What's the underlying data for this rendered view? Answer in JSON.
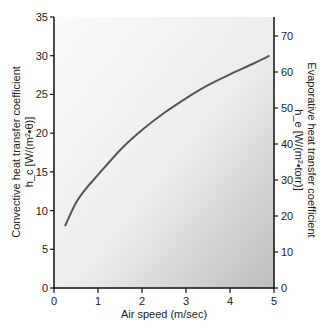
{
  "chart_data": {
    "type": "line",
    "title": "",
    "xlabel": "Air speed (m/sec)",
    "ylabel": "Convective heat transfer coefficient",
    "ylabel_units": "h_c [W/(m²•θ)]",
    "ylabel_right": "Evaporative heat transfer coefficient",
    "ylabel_right_units": "h_e [W/(m²•torr)]",
    "xlim": [
      0,
      5
    ],
    "ylim": [
      0,
      35
    ],
    "ylim_right": [
      0,
      80
    ],
    "x_ticks": [
      "0",
      "1",
      "2",
      "3",
      "4",
      "5"
    ],
    "y_ticks": [
      "0",
      "5",
      "10",
      "15",
      "20",
      "25",
      "30",
      "35"
    ],
    "y_right_ticks": [
      "0",
      "10",
      "20",
      "30",
      "40",
      "50",
      "60",
      "70"
    ],
    "grid": false,
    "legend": null,
    "series": [
      {
        "name": "h_c vs air speed",
        "x": [
          0.25,
          0.5,
          0.75,
          1.0,
          1.5,
          2.0,
          2.5,
          3.0,
          3.5,
          4.0,
          4.5,
          4.9
        ],
        "y": [
          8.0,
          11.0,
          13.0,
          14.6,
          17.8,
          20.4,
          22.6,
          24.5,
          26.2,
          27.6,
          28.9,
          30.0
        ]
      }
    ]
  }
}
